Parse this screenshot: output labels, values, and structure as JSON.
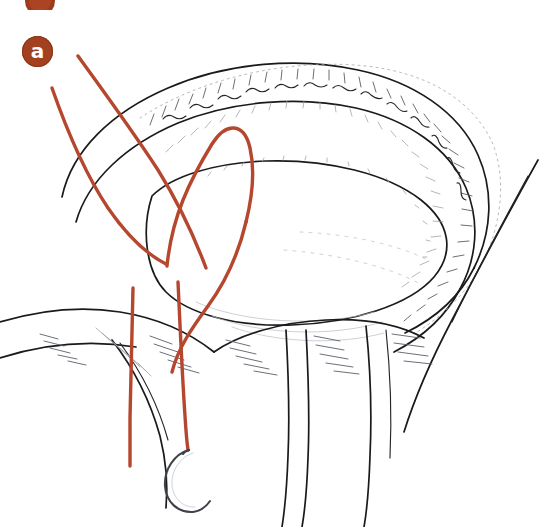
{
  "figure": {
    "domain_label": "surgical-illustration",
    "caption_strip": {
      "badge_color": "#a2401f",
      "title": ""
    },
    "panel_label": {
      "letter": "a",
      "badge_color": "#a2401f",
      "text_color": "#ffffff"
    },
    "palette": {
      "background": "#ffffff",
      "ink_dark": "#1a1a1a",
      "ink_mid": "#5a5f66",
      "ink_light": "#9aa0a8",
      "suture": "#b5472e",
      "suture_dark": "#9e3b24",
      "needle_steel": "#4a4f55"
    },
    "structures": [
      {
        "name": "annulus-ring-outer",
        "kind": "outline"
      },
      {
        "name": "annulus-ring-inner",
        "kind": "outline"
      },
      {
        "name": "annulus-rim-shading",
        "kind": "hatching"
      },
      {
        "name": "ventricular-wall-lower",
        "kind": "outline"
      },
      {
        "name": "tissue-flap-left",
        "kind": "outline"
      },
      {
        "name": "tissue-flap-center",
        "kind": "outline"
      },
      {
        "name": "tissue-flap-right",
        "kind": "outline"
      },
      {
        "name": "lateral-wall-right",
        "kind": "outline"
      }
    ],
    "sutures": [
      {
        "id": "suture-1",
        "label": "left long tail"
      },
      {
        "id": "suture-2",
        "label": "left crossing strand"
      },
      {
        "id": "suture-3",
        "label": "first u-stitch loop"
      },
      {
        "id": "suture-4",
        "label": "second u-stitch loop"
      },
      {
        "id": "suture-5",
        "label": "lower left tail"
      },
      {
        "id": "suture-6",
        "label": "needle tail strand"
      }
    ],
    "instrument": {
      "name": "curved-surgical-needle",
      "shape": "half-circle taper needle",
      "attached_to": "suture-6"
    }
  }
}
